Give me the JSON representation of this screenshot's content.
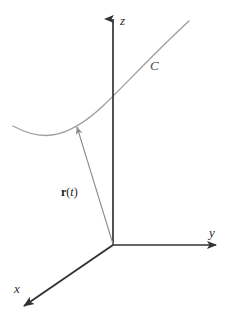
{
  "figure": {
    "background_color": "#ffffff"
  },
  "axes": {
    "origin": {
      "x": 113,
      "y": 245
    },
    "color": "#333333",
    "z": {
      "label": "z",
      "label_x": 120,
      "label_y": 14,
      "from": {
        "x": 113,
        "y": 245
      },
      "to": {
        "x": 113,
        "y": 19
      }
    },
    "y": {
      "label": "y",
      "label_x": 209,
      "label_y": 226,
      "from": {
        "x": 113,
        "y": 245
      },
      "to": {
        "x": 216,
        "y": 245
      }
    },
    "x": {
      "label": "x",
      "label_x": 14,
      "label_y": 282,
      "from": {
        "x": 113,
        "y": 245
      },
      "to": {
        "x": 24,
        "y": 306
      }
    }
  },
  "curve": {
    "name": "C",
    "label": "C",
    "label_x": 150,
    "label_y": 59,
    "color": "#a0a0a0",
    "stroke_width": 1.4,
    "path": "M 13 126 C 26 133, 38 137, 52 135 C 68 133, 86 122, 104 105 C 126 84, 152 55, 189 21"
  },
  "vector": {
    "label_symbol": "r",
    "label_open": "(",
    "label_param": "t",
    "label_close": ")",
    "label_x": 61,
    "label_y": 186,
    "color": "#8c8c8c",
    "stroke_width": 1.1,
    "tail": {
      "x": 113,
      "y": 244
    },
    "head": {
      "x": 77,
      "y": 127
    }
  },
  "colors": {
    "axis": "#333333",
    "curve": "#a0a0a0",
    "vector": "#8c8c8c",
    "text": "#1c1c1c",
    "background": "#ffffff"
  }
}
